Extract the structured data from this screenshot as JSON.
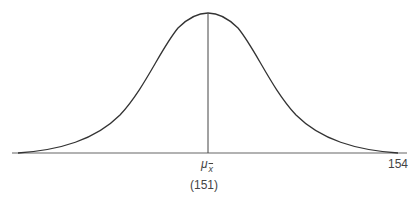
{
  "diagram": {
    "type": "normal-distribution-curve",
    "mean_symbol": "μ",
    "mean_subscript": "x",
    "mean_value_label": "(151)",
    "right_tick_label": "154",
    "colors": {
      "curve": "#333333",
      "axis": "#666666",
      "mean_line": "#444444",
      "text": "#444444",
      "background": "#ffffff"
    }
  }
}
